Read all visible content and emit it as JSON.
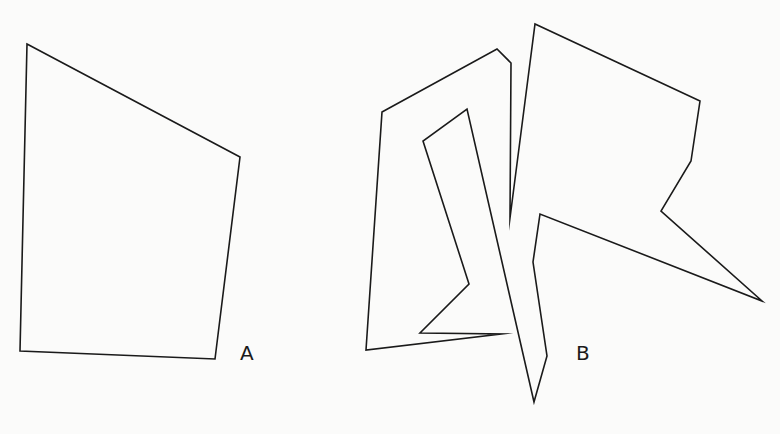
{
  "figure": {
    "background": "#fbfbfa",
    "stroke_color": "#1a1a1a",
    "shapes": [
      {
        "id": "A",
        "label": "A",
        "label_pos": [
          240,
          343
        ],
        "points": [
          [
            27,
            44
          ],
          [
            240,
            157
          ],
          [
            215,
            359
          ],
          [
            20,
            351
          ]
        ]
      },
      {
        "id": "B",
        "label": "B",
        "label_pos": [
          576,
          343
        ],
        "points": [
          [
            382,
            112
          ],
          [
            497,
            49
          ],
          [
            511,
            63
          ],
          [
            510,
            218
          ],
          [
            535,
            24
          ],
          [
            700,
            101
          ],
          [
            691,
            161
          ],
          [
            661,
            211
          ],
          [
            762,
            301
          ],
          [
            540,
            214
          ],
          [
            533,
            262
          ],
          [
            547,
            356
          ],
          [
            534,
            402
          ],
          [
            467,
            109
          ],
          [
            423,
            141
          ],
          [
            469,
            284
          ],
          [
            420,
            333
          ],
          [
            501,
            334
          ],
          [
            366,
            350
          ]
        ]
      }
    ]
  }
}
